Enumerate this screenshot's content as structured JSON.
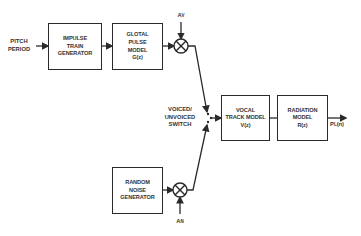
{
  "diagram": {
    "title": "",
    "input_label": [
      "PITCH",
      "PERIOD"
    ],
    "blocks": {
      "impulse": [
        "IMPULSE",
        "TRAIN",
        "GENERATOR"
      ],
      "glottal": [
        "GLOTAL",
        "PULSE",
        "MODEL",
        "G(z)"
      ],
      "noise": [
        "RANDOM",
        "NOISE",
        "GENERATOR"
      ],
      "vocal": [
        "VOCAL",
        "TRACK MODEL",
        "V(z)"
      ],
      "radiation": [
        "RADIATION",
        "MODEL",
        "R(z)"
      ]
    },
    "switch_label": [
      "VOICED/",
      "UNVOICED",
      "SWITCH"
    ],
    "gain_voiced": {
      "main": "A",
      "sub": "V"
    },
    "gain_noise": {
      "main": "A",
      "sub": "N"
    },
    "output": {
      "main": "P",
      "sub": "L",
      "suffix": "(n)"
    },
    "line_color": "#2a2a2a"
  }
}
